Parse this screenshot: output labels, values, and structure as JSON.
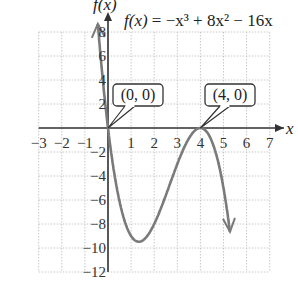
{
  "chart_data": {
    "type": "line",
    "title": "f(x) = −x³ + 8x² − 16x",
    "function": "f(x) = -x^3 + 8x^2 - 16x",
    "xlabel": "x",
    "ylabel": "f(x)",
    "xlim": [
      -3,
      7
    ],
    "ylim": [
      -12,
      8
    ],
    "grid": true,
    "x_ticks": [
      "−3",
      "−2",
      "−1",
      "1",
      "2",
      "3",
      "4",
      "5",
      "6",
      "7"
    ],
    "y_ticks": [
      "8",
      "6",
      "4",
      "2",
      "−2",
      "−4",
      "−6",
      "−8",
      "−10",
      "−12"
    ],
    "annotations": [
      {
        "text": "(0, 0)",
        "x": 0,
        "y": 0
      },
      {
        "text": "(4, 0)",
        "x": 4,
        "y": 0
      }
    ],
    "series": [
      {
        "name": "f(x)",
        "x": [
          -0.45,
          -0.3,
          0,
          0.5,
          1,
          1.33,
          2,
          3,
          4,
          4.5,
          5,
          5.3
        ],
        "y": [
          8.9,
          5.6,
          0,
          -6.1,
          -9,
          -9.5,
          -8,
          -3,
          0,
          -2.3,
          -5,
          -11.9
        ]
      }
    ],
    "color": "#7a7a7a"
  },
  "labels": {
    "title_prefix": "f(x)",
    "title_eq": " = −x³ + 8x² − 16x",
    "ylabel": "f(x)",
    "xlabel": "x",
    "box1": "(0, 0)",
    "box2": "(4, 0)"
  }
}
